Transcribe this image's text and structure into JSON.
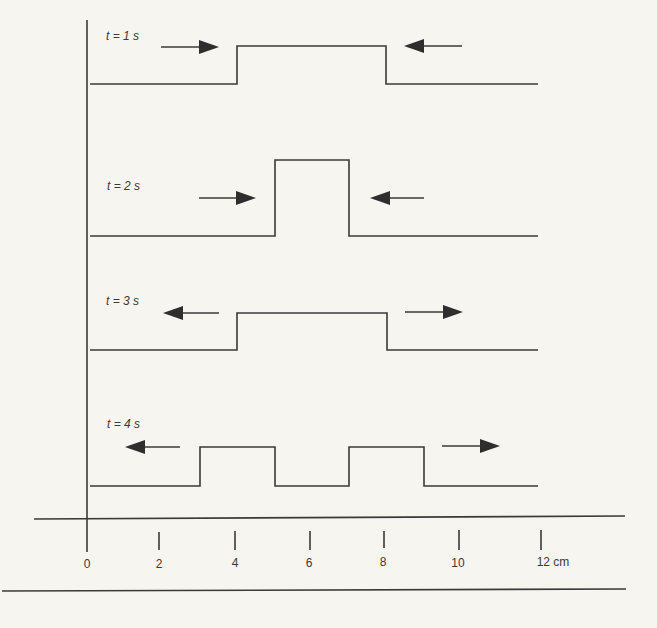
{
  "figure": {
    "type": "pulse-superposition-diagram",
    "rows": [
      {
        "label": "t = 1 s",
        "baseline_y": 84,
        "top_y": 46,
        "profile_x": [
          237,
          386
        ],
        "arrows": [
          {
            "dir": "right",
            "x1": 161,
            "x2": 219,
            "y": 47
          },
          {
            "dir": "left",
            "x1": 404,
            "x2": 462,
            "y": 46
          }
        ]
      },
      {
        "label": "t = 2 s",
        "baseline_y": 236,
        "top_y": 160,
        "profile_x": [
          275,
          349
        ],
        "arrows": [
          {
            "dir": "right",
            "x1": 199,
            "x2": 256,
            "y": 198
          },
          {
            "dir": "left",
            "x1": 370,
            "x2": 424,
            "y": 198
          }
        ]
      },
      {
        "label": "t = 3 s",
        "baseline_y": 350,
        "top_y": 313,
        "profile_x": [
          237,
          387
        ],
        "arrows": [
          {
            "dir": "left",
            "x1": 163,
            "x2": 219,
            "y": 313
          },
          {
            "dir": "right",
            "x1": 405,
            "x2": 463,
            "y": 312
          }
        ]
      },
      {
        "label": "t = 4 s",
        "baseline_y": 486,
        "top_y": 447,
        "profile_x": [
          200,
          275,
          349,
          424
        ],
        "arrows": [
          {
            "dir": "left",
            "x1": 125,
            "x2": 180,
            "y": 447
          },
          {
            "dir": "right",
            "x1": 442,
            "x2": 500,
            "y": 446
          }
        ]
      }
    ],
    "axis": {
      "unit": "cm",
      "ticks": [
        {
          "value": "0",
          "x": 88
        },
        {
          "value": "2",
          "x": 159
        },
        {
          "value": "4",
          "x": 235
        },
        {
          "value": "6",
          "x": 310
        },
        {
          "value": "8",
          "x": 384
        },
        {
          "value": "10",
          "x": 459
        },
        {
          "value": "12 cm",
          "x": 541
        }
      ]
    }
  },
  "labels": {
    "t1": "t = 1 s",
    "t2": "t = 2 s",
    "t3": "t = 3 s",
    "t4": "t = 4 s",
    "tick0": "0",
    "tick2": "2",
    "tick4": "4",
    "tick6": "6",
    "tick8": "8",
    "tick10": "10",
    "tick12": "12 cm"
  },
  "colors": {
    "line": "#3a3a3a",
    "background": "#f7f5f0"
  }
}
